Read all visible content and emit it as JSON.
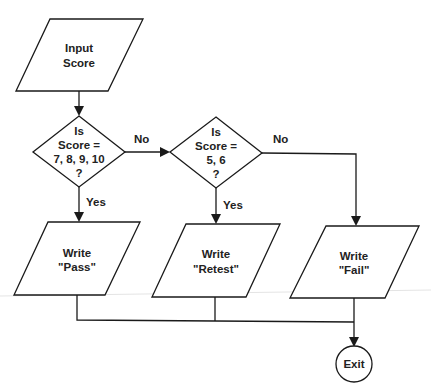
{
  "diagram": {
    "type": "flowchart",
    "nodes": [
      {
        "id": "input",
        "shape": "parallelogram",
        "lines": [
          "Input",
          "Score"
        ]
      },
      {
        "id": "decision1",
        "shape": "diamond",
        "lines": [
          "Is",
          "Score =",
          "7, 8, 9, 10",
          "?"
        ]
      },
      {
        "id": "decision2",
        "shape": "diamond",
        "lines": [
          "Is",
          "Score =",
          "5, 6",
          "?"
        ]
      },
      {
        "id": "pass",
        "shape": "parallelogram",
        "lines": [
          "Write",
          "\"Pass\""
        ]
      },
      {
        "id": "retest",
        "shape": "parallelogram",
        "lines": [
          "Write",
          "\"Retest\""
        ]
      },
      {
        "id": "fail",
        "shape": "parallelogram",
        "lines": [
          "Write",
          "\"Fail\""
        ]
      },
      {
        "id": "exit",
        "shape": "circle",
        "lines": [
          "Exit"
        ]
      }
    ],
    "edges": [
      {
        "from": "input",
        "to": "decision1",
        "label": ""
      },
      {
        "from": "decision1",
        "to": "decision2",
        "label": "No"
      },
      {
        "from": "decision1",
        "to": "pass",
        "label": "Yes"
      },
      {
        "from": "decision2",
        "to": "retest",
        "label": "Yes"
      },
      {
        "from": "decision2",
        "to": "fail",
        "label": "No"
      },
      {
        "from": "pass",
        "to": "exit",
        "label": ""
      },
      {
        "from": "retest",
        "to": "exit",
        "label": ""
      },
      {
        "from": "fail",
        "to": "exit",
        "label": ""
      }
    ]
  },
  "labels": {
    "input": {
      "l1": "Input",
      "l2": "Score"
    },
    "decision1": {
      "l1": "Is",
      "l2": "Score =",
      "l3": "7, 8, 9, 10",
      "l4": "?"
    },
    "decision2": {
      "l1": "Is",
      "l2": "Score =",
      "l3": "5, 6",
      "l4": "?"
    },
    "pass": {
      "l1": "Write",
      "l2": "\"Pass\""
    },
    "retest": {
      "l1": "Write",
      "l2": "\"Retest\""
    },
    "fail": {
      "l1": "Write",
      "l2": "\"Fail\""
    },
    "exit": {
      "l1": "Exit"
    },
    "edge_no_1": "No",
    "edge_no_2": "No",
    "edge_yes_1": "Yes",
    "edge_yes_2": "Yes"
  }
}
